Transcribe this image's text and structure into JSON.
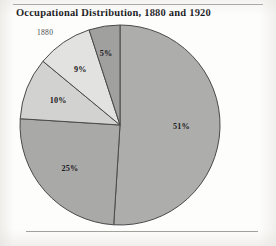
{
  "figure": {
    "title": "Occupational Distribution, 1880 and 1920",
    "year_caption": "1880"
  },
  "chart_data": {
    "type": "pie",
    "title": "Occupational Distribution, 1880 and 1920",
    "subtitle": "1880",
    "xlabel": "",
    "ylabel": "",
    "grid": false,
    "legend": "none",
    "start_angle_deg": 0,
    "direction": "clockwise",
    "total": 100,
    "unit": "%",
    "categories": [
      "51%",
      "25%",
      "10%",
      "9%",
      "5%"
    ],
    "values": [
      51,
      25,
      10,
      9,
      5
    ],
    "labels": [
      "51%",
      "25%",
      "10%",
      "9%",
      "5%"
    ],
    "colors": [
      "#adadab",
      "#a9a9a7",
      "#d2d2d0",
      "#e2e2e0",
      "#a0a09e"
    ],
    "slices": [
      {
        "label": "51%",
        "value": 51,
        "color": "#adadab"
      },
      {
        "label": "25%",
        "value": 25,
        "color": "#a9a9a7"
      },
      {
        "label": "10%",
        "value": 10,
        "color": "#d2d2d0"
      },
      {
        "label": "9%",
        "value": 9,
        "color": "#e2e2e0"
      },
      {
        "label": "5%",
        "value": 5,
        "color": "#a0a09e"
      }
    ]
  }
}
